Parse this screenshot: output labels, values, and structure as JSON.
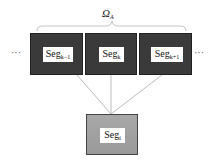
{
  "diagram": {
    "group_label": {
      "symbol": "Ω",
      "subscript": "A"
    },
    "ellipsis_left": "···",
    "ellipsis_right": "···",
    "top_segments": [
      {
        "base": "Seg",
        "subscript": "k−1"
      },
      {
        "base": "Seg",
        "subscript": "k"
      },
      {
        "base": "Seg",
        "subscript": "k+1"
      }
    ],
    "bottom_segment": {
      "base": "Seg",
      "subscript": "i"
    },
    "colors": {
      "top_box_fill": "#3a3a3a",
      "bottom_box_fill": "#a0a0a0",
      "label_fill": "#ffffff",
      "connector_line": "#bdbdbd",
      "bracket_line": "#c8c8c8"
    }
  }
}
